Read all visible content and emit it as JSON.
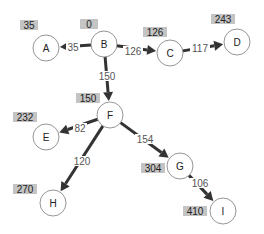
{
  "diagram": {
    "type": "shortest-path-tree",
    "nodes": [
      {
        "id": "A",
        "label": "A",
        "distance": "35"
      },
      {
        "id": "B",
        "label": "B",
        "distance": "0"
      },
      {
        "id": "C",
        "label": "C",
        "distance": "126"
      },
      {
        "id": "D",
        "label": "D",
        "distance": "243"
      },
      {
        "id": "E",
        "label": "E",
        "distance": "232"
      },
      {
        "id": "F",
        "label": "F",
        "distance": "150"
      },
      {
        "id": "G",
        "label": "G",
        "distance": "304"
      },
      {
        "id": "H",
        "label": "H",
        "distance": "270"
      },
      {
        "id": "I",
        "label": "I",
        "distance": "410"
      }
    ],
    "edges": [
      {
        "from": "B",
        "to": "A",
        "weight": "35"
      },
      {
        "from": "B",
        "to": "C",
        "weight": "126"
      },
      {
        "from": "C",
        "to": "D",
        "weight": "117"
      },
      {
        "from": "B",
        "to": "F",
        "weight": "150"
      },
      {
        "from": "F",
        "to": "E",
        "weight": "82"
      },
      {
        "from": "F",
        "to": "G",
        "weight": "154"
      },
      {
        "from": "F",
        "to": "H",
        "weight": "120"
      },
      {
        "from": "G",
        "to": "I",
        "weight": "106"
      }
    ],
    "colors": {
      "edge": "#333333",
      "distance_box": "#c4c4c4",
      "node_border": "#8a8a8a"
    }
  }
}
